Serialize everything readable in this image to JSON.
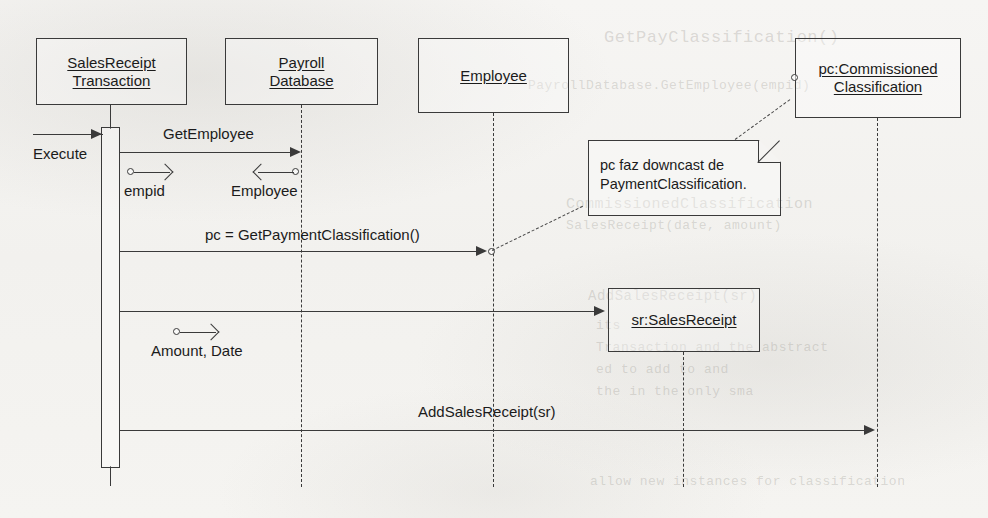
{
  "diagram": {
    "ink_color": "#3a3a3a",
    "paper_color": "#f4f3f1"
  },
  "participants": [
    {
      "id": "salesreceipt-transaction",
      "line1": "SalesReceipt",
      "line2": "Transaction"
    },
    {
      "id": "payroll-database",
      "line1": "Payroll",
      "line2": "Database"
    },
    {
      "id": "employee",
      "line1": "Employee",
      "line2": ""
    },
    {
      "id": "pc-commissioned-classification",
      "line1": "pc:Commissioned",
      "line2": "Classification"
    },
    {
      "id": "sr-salesreceipt",
      "line1": "sr:SalesReceipt",
      "line2": ""
    }
  ],
  "messages": [
    {
      "id": "execute",
      "label": "Execute"
    },
    {
      "id": "get-employee",
      "label": "GetEmployee"
    },
    {
      "id": "get-payment-classification",
      "label": "pc = GetPaymentClassification()"
    },
    {
      "id": "create-sales-receipt",
      "label": ""
    },
    {
      "id": "add-sales-receipt",
      "label": "AddSalesReceipt(sr)"
    }
  ],
  "parameters": [
    {
      "id": "empid",
      "label": "empid",
      "direction": "out"
    },
    {
      "id": "employee-return",
      "label": "Employee",
      "direction": "in"
    },
    {
      "id": "amount-date",
      "label": "Amount, Date",
      "direction": "out"
    }
  ],
  "note": {
    "id": "downcast-note",
    "text": "pc faz downcast de\nPaymentClassification."
  },
  "ghost_text": {
    "line1": "GetPayClassification()",
    "line2": "PayrollDatabase.GetEmployee(empid)",
    "line3": "CommissionedClassification",
    "line4": "SalesReceipt(date, amount)",
    "line5": "AddSalesReceipt(sr)",
    "line6": "its",
    "line7": "Transaction and the abstract",
    "line8": "ed to add to and",
    "line9": "the in the only sma",
    "line10": "allow new instances for classification"
  }
}
